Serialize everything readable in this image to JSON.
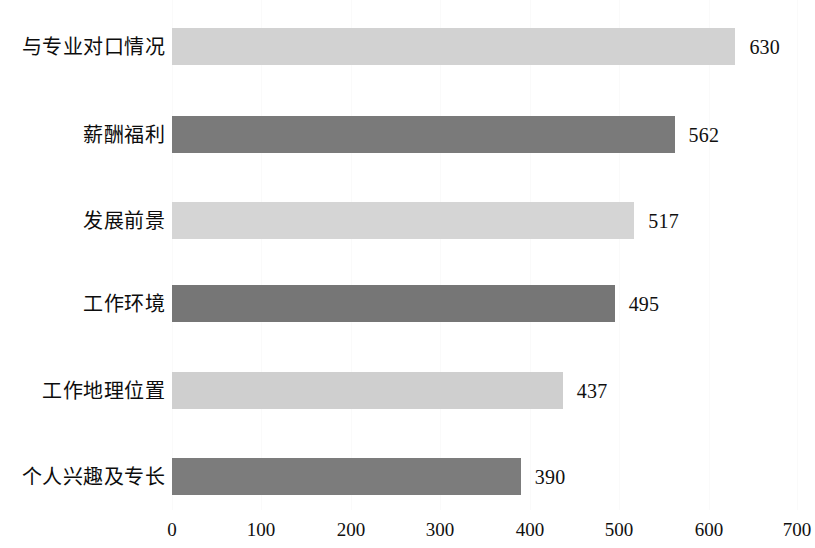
{
  "chart_data": {
    "type": "bar",
    "orientation": "horizontal",
    "title": "",
    "subtitle": "",
    "xlabel": "",
    "ylabel": "",
    "categories": [
      "与专业对口情况",
      "薪酬福利",
      "发展前景",
      "工作环境",
      "工作地理位置",
      "个人兴趣及专长"
    ],
    "values": [
      630,
      562,
      517,
      495,
      437,
      390
    ],
    "value_labels": [
      "630",
      "562",
      "517",
      "495",
      "437",
      "390"
    ],
    "bar_colors": [
      "#d2d2d2",
      "#7a7a7a",
      "#d5d5d5",
      "#767676",
      "#cfcfcf",
      "#7c7c7c"
    ],
    "xlim": [
      0,
      700
    ],
    "xticks": [
      0,
      100,
      200,
      300,
      400,
      500,
      600,
      700
    ],
    "xtick_labels": [
      "0",
      "100",
      "200",
      "300",
      "400",
      "500",
      "600",
      "700"
    ],
    "grid": true,
    "grid_axis": "x",
    "grid_color": "#fafafa",
    "legend": false,
    "legend_position": "none",
    "background_color": "#ffffff",
    "text_color": "#0d0d0d"
  }
}
